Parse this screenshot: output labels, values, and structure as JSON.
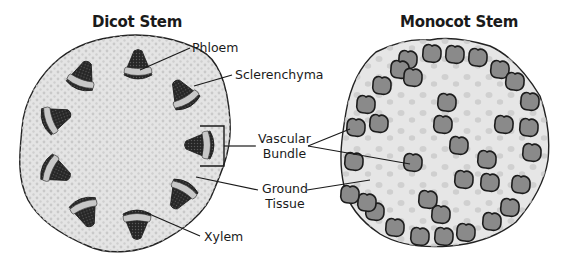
{
  "titles": {
    "dicot": "Dicot Stem",
    "monocot": "Monocot Stem"
  },
  "labels": {
    "phloem": "Phloem",
    "sclerenchyma": "Sclerenchyma",
    "vascular_bundle_line1": "Vascular",
    "vascular_bundle_line2": "Bundle",
    "ground_tissue_line1": "Ground",
    "ground_tissue_line2": "Tissue",
    "xylem": "Xylem"
  },
  "colors": {
    "stem_fill": "#e4e4e4",
    "stem_outline": "#222222",
    "speckle": "#c4c4c4",
    "bundle_dark": "#2e2e2e",
    "bundle_band": "#c8c8c8",
    "monocot_bundle": "#8a8a8a",
    "monocot_outline": "#1c1c1c"
  },
  "dicot_bundles": [
    {
      "x": 82,
      "y": 78,
      "angle": 200
    },
    {
      "x": 138,
      "y": 67,
      "angle": 180
    },
    {
      "x": 184,
      "y": 96,
      "angle": 150
    },
    {
      "x": 202,
      "y": 145,
      "angle": 90
    },
    {
      "x": 182,
      "y": 193,
      "angle": 30
    },
    {
      "x": 137,
      "y": 222,
      "angle": 0
    },
    {
      "x": 85,
      "y": 210,
      "angle": -20
    },
    {
      "x": 54,
      "y": 170,
      "angle": -65
    },
    {
      "x": 54,
      "y": 119,
      "angle": -110
    }
  ],
  "monocot_bundles": [
    [
      408,
      60
    ],
    [
      432,
      54
    ],
    [
      455,
      55
    ],
    [
      478,
      58
    ],
    [
      500,
      70
    ],
    [
      515,
      82
    ],
    [
      530,
      102
    ],
    [
      529,
      128
    ],
    [
      532,
      153
    ],
    [
      521,
      185
    ],
    [
      510,
      208
    ],
    [
      492,
      222
    ],
    [
      466,
      233
    ],
    [
      444,
      237
    ],
    [
      420,
      237
    ],
    [
      395,
      228
    ],
    [
      375,
      212
    ],
    [
      367,
      203
    ],
    [
      350,
      195
    ],
    [
      354,
      162
    ],
    [
      356,
      128
    ],
    [
      366,
      105
    ],
    [
      382,
      86
    ],
    [
      400,
      70
    ],
    [
      413,
      78
    ],
    [
      447,
      103
    ],
    [
      443,
      125
    ],
    [
      459,
      146
    ],
    [
      487,
      160
    ],
    [
      464,
      180
    ],
    [
      490,
      183
    ],
    [
      441,
      215
    ],
    [
      428,
      200
    ],
    [
      379,
      124
    ],
    [
      413,
      163
    ],
    [
      504,
      125
    ]
  ]
}
